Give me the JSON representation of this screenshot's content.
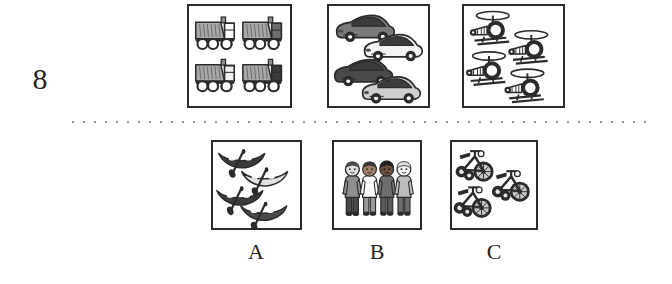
{
  "item": {
    "number": "8",
    "type": "picture-analogy-multiple-choice"
  },
  "divider": {
    "style": "dotted",
    "color": "#9a9a9a"
  },
  "stimulus_panels": [
    {
      "name": "trucks",
      "icon": "dump-truck-icon",
      "label": "dump trucks",
      "count": 4,
      "arrangement": "2x2 grid",
      "colors": [
        "#9e9e9e",
        "#ffffff",
        "#6e6e6e",
        "#2b2b2b"
      ]
    },
    {
      "name": "cars",
      "icon": "car-icon",
      "label": "cars",
      "count": 4,
      "arrangement": "staggered 2x2",
      "colors": [
        "#7a7a7a",
        "#f2f2f2",
        "#4a4a4a",
        "#c9c9c9"
      ]
    },
    {
      "name": "helicopters",
      "icon": "helicopter-icon",
      "label": "helicopters",
      "count": 4,
      "arrangement": "staggered 2x2",
      "colors": [
        "#ffffff",
        "#2b2b2b"
      ]
    }
  ],
  "options": [
    {
      "letter": "A",
      "name": "canoes",
      "icon": "canoe-icon",
      "label": "canoes with paddles",
      "count": 4,
      "arrangement": "staggered column",
      "colors": [
        "#3c3c3c",
        "#d8d8d8"
      ]
    },
    {
      "letter": "B",
      "name": "children",
      "icon": "child-icon",
      "label": "children standing",
      "count": 4,
      "arrangement": "row",
      "colors": [
        "#8a8a8a",
        "#ffffff",
        "#5a5a5a",
        "#d0d0d0"
      ]
    },
    {
      "letter": "C",
      "name": "tricycles",
      "icon": "tricycle-icon",
      "label": "tricycles",
      "count": 3,
      "arrangement": "staggered",
      "colors": [
        "#2b2b2b",
        "#9e9e9e"
      ]
    }
  ],
  "answer_letters": {
    "a": "A",
    "b": "B",
    "c": "C"
  }
}
